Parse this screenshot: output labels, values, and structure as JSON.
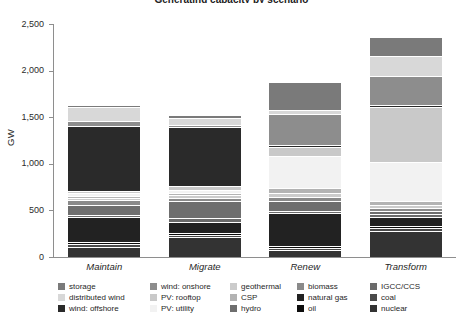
{
  "chart_title": "Generating capacity by scenario",
  "y_axis": {
    "title": "GW",
    "ticks": [
      "0",
      "500",
      "1,000",
      "1,500",
      "2,000",
      "2,500"
    ],
    "min": 0,
    "max": 2500
  },
  "x_axis": {
    "categories": [
      "Maintain",
      "Migrate",
      "Renew",
      "Transform"
    ]
  },
  "legend": {
    "columns": [
      {
        "items": [
          {
            "label": "storage",
            "color": "#7a7a7a"
          },
          {
            "label": "distributed wind",
            "color": "#d8d8d8"
          },
          {
            "label": "wind: offshore",
            "color": "#2a2a2a"
          }
        ]
      },
      {
        "items": [
          {
            "label": "wind: onshore",
            "color": "#8d8d8d"
          },
          {
            "label": "PV: rooftop",
            "color": "#c9c9c9"
          },
          {
            "label": "PV: utility",
            "color": "#f2f2f2"
          }
        ]
      },
      {
        "items": [
          {
            "label": "geothermal",
            "color": "#cbcbcb"
          },
          {
            "label": "CSP",
            "color": "#b3b3b3"
          },
          {
            "label": "hydro",
            "color": "#6e6e6e"
          }
        ]
      },
      {
        "items": [
          {
            "label": "biomass",
            "color": "#8a8a8a"
          },
          {
            "label": "natural gas",
            "color": "#222222"
          },
          {
            "label": "oil",
            "color": "#0d0d0d"
          }
        ]
      },
      {
        "items": [
          {
            "label": "IGCC/CCS",
            "color": "#6b6b6b"
          },
          {
            "label": "coal",
            "color": "#4a4a4a"
          },
          {
            "label": "nuclear",
            "color": "#333333"
          }
        ]
      }
    ]
  },
  "chart_data": {
    "type": "bar",
    "stacked": true,
    "title": "Generating capacity by scenario",
    "xlabel": "",
    "ylabel": "GW",
    "ylim": [
      0,
      2500
    ],
    "ytick_values": [
      0,
      500,
      1000,
      1500,
      2000,
      2500
    ],
    "grid": false,
    "legend_position": "bottom",
    "categories": [
      "Maintain",
      "Migrate",
      "Renew",
      "Transform"
    ],
    "stack_order_bottom_to_top": [
      "nuclear",
      "coal",
      "oil",
      "natural gas",
      "IGCC/CCS",
      "hydro",
      "biomass",
      "geothermal",
      "CSP",
      "PV: utility",
      "PV: rooftop",
      "wind: offshore",
      "wind: onshore",
      "distributed wind",
      "storage"
    ],
    "series": [
      {
        "name": "nuclear",
        "color": "#333333",
        "values": [
          95,
          200,
          65,
          270
        ]
      },
      {
        "name": "coal",
        "color": "#4a4a4a",
        "values": [
          20,
          15,
          10,
          15
        ]
      },
      {
        "name": "oil",
        "color": "#0d0d0d",
        "values": [
          15,
          10,
          10,
          10
        ]
      },
      {
        "name": "natural gas",
        "color": "#222222",
        "values": [
          260,
          110,
          335,
          85
        ]
      },
      {
        "name": "IGCC/CCS",
        "color": "#6b6b6b",
        "values": [
          10,
          25,
          20,
          30
        ]
      },
      {
        "name": "hydro",
        "color": "#6e6e6e",
        "values": [
          95,
          170,
          90,
          20
        ]
      },
      {
        "name": "biomass",
        "color": "#8a8a8a",
        "values": [
          40,
          25,
          30,
          20
        ]
      },
      {
        "name": "geothermal",
        "color": "#cbcbcb",
        "values": [
          10,
          20,
          35,
          25
        ]
      },
      {
        "name": "CSP",
        "color": "#b3b3b3",
        "values": [
          10,
          15,
          45,
          25
        ]
      },
      {
        "name": "PV: utility",
        "color": "#f2f2f2",
        "values": [
          15,
          20,
          330,
          410
        ]
      },
      {
        "name": "PV: rooftop",
        "color": "#c9c9c9",
        "values": [
          10,
          30,
          90,
          575
        ]
      },
      {
        "name": "wind: offshore",
        "color": "#2a2a2a",
        "values": [
          690,
          620,
          10,
          20
        ]
      },
      {
        "name": "wind: onshore",
        "color": "#8d8d8d",
        "values": [
          40,
          20,
          320,
          300
        ]
      },
      {
        "name": "distributed wind",
        "color": "#d8d8d8",
        "values": [
          135,
          60,
          30,
          195
        ]
      },
      {
        "name": "storage",
        "color": "#7a7a7a",
        "values": [
          15,
          25,
          290,
          200
        ]
      }
    ],
    "totals": [
      1460,
      1365,
      1710,
      2200
    ]
  }
}
